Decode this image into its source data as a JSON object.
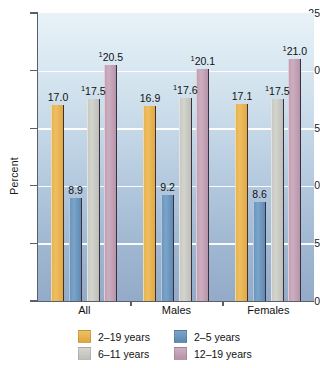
{
  "chart_data": {
    "type": "bar",
    "title": "",
    "xlabel": "",
    "ylabel": "Percent",
    "ylim": [
      0,
      25
    ],
    "yticks": [
      0,
      5,
      10,
      15,
      20,
      25
    ],
    "ytick_labels": [
      "0",
      "5",
      "10",
      "15",
      "20",
      "25"
    ],
    "grid": true,
    "legend_position": "bottom",
    "categories": [
      "All",
      "Males",
      "Females"
    ],
    "series": [
      {
        "name": "2–19 years",
        "color": "#e2a93f",
        "values": [
          17.0,
          16.9,
          17.1
        ],
        "labels": [
          "17.0",
          "16.9",
          "17.1"
        ],
        "footnote_marks": [
          "",
          "",
          ""
        ]
      },
      {
        "name": "2–5 years",
        "color": "#6b95bd",
        "values": [
          8.9,
          9.2,
          8.6
        ],
        "labels": [
          "8.9",
          "9.2",
          "8.6"
        ],
        "footnote_marks": [
          "",
          "",
          ""
        ]
      },
      {
        "name": "6–11 years",
        "color": "#c9c9c4",
        "values": [
          17.5,
          17.6,
          17.5
        ],
        "labels": [
          "17.5",
          "17.6",
          "17.5"
        ],
        "footnote_marks": [
          "1",
          "1",
          "1"
        ]
      },
      {
        "name": "12–19 years",
        "color": "#c2a0b4",
        "values": [
          20.5,
          20.1,
          21.0
        ],
        "labels": [
          "20.5",
          "20.1",
          "21.0"
        ],
        "footnote_marks": [
          "1",
          "1",
          "1"
        ]
      }
    ]
  },
  "axis": {
    "y_label": "Percent",
    "y_ticks": [
      "25",
      "20",
      "15",
      "10",
      "5",
      "0"
    ]
  },
  "groups": [
    {
      "label": "All"
    },
    {
      "label": "Males"
    },
    {
      "label": "Females"
    }
  ],
  "legend": {
    "items": [
      {
        "label": "2–19 years",
        "swatch": "goldenrod-swatch"
      },
      {
        "label": "2–5 years",
        "swatch": "steelblue-swatch"
      },
      {
        "label": "6–11 years",
        "swatch": "gray-swatch"
      },
      {
        "label": "12–19 years",
        "swatch": "mauve-swatch"
      }
    ]
  }
}
